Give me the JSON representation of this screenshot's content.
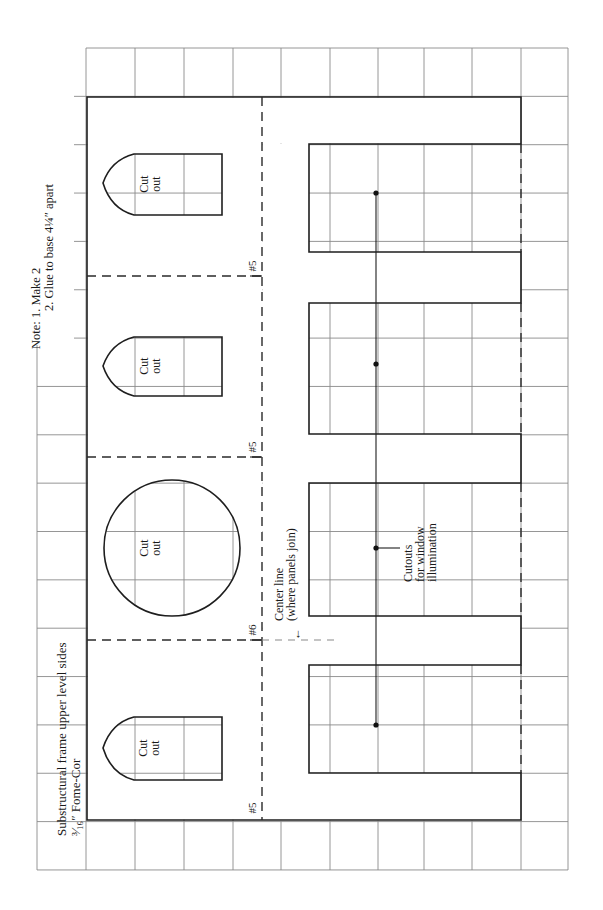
{
  "title": {
    "line1": "Substructural frame upper level sides",
    "line2": "³⁄₁₆″ Fome-Cor"
  },
  "note": {
    "line1": "Note:  1.  Make 2",
    "line2": "2.  Glue to base 4¼″ apart"
  },
  "cutouts": {
    "arch_top": {
      "line1": "Cut",
      "line2": "out"
    },
    "arch_middle": {
      "line1": "Cut",
      "line2": "out"
    },
    "circle": {
      "line1": "Cut",
      "line2": "out"
    },
    "arch_bottom": {
      "line1": "Cut",
      "line2": "out"
    }
  },
  "fold_labels": {
    "top": "#5",
    "upper_middle": "#5",
    "center": "#6",
    "bottom": "#5"
  },
  "center_line": {
    "line1": "Center line",
    "line2": "(where panels join)",
    "arrow": "←"
  },
  "window_label": {
    "line1": "Cutouts",
    "line2": "for window",
    "line3": "illumination"
  }
}
